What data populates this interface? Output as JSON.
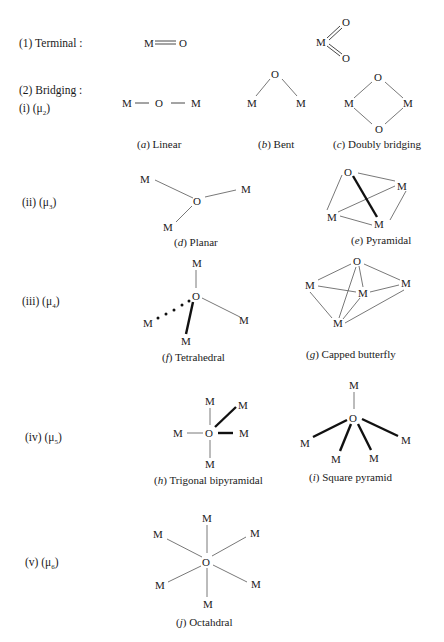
{
  "sections": [
    {
      "id": "terminal",
      "label": "(1) Terminal :"
    },
    {
      "id": "bridging",
      "label": "(2) Bridging :"
    },
    {
      "id": "mu2",
      "label": "(i) (μ",
      "sub": "2",
      "close": ")"
    },
    {
      "id": "mu3",
      "label": "(ii) (μ",
      "sub": "3",
      "close": ")"
    },
    {
      "id": "mu4",
      "label": "(iii) (μ",
      "sub": "4",
      "close": ")"
    },
    {
      "id": "mu5",
      "label": "(iv) (μ",
      "sub": "5",
      "close": ")"
    },
    {
      "id": "mu6",
      "label": "(v) (μ",
      "sub": "6",
      "close": ")"
    }
  ],
  "atoms": {
    "metal": "M",
    "oxygen": "O"
  },
  "captions": {
    "a": {
      "letter": "a",
      "text": "Linear"
    },
    "b": {
      "letter": "b",
      "text": "Bent"
    },
    "c": {
      "letter": "c",
      "text": "Doubly bridging"
    },
    "d": {
      "letter": "d",
      "text": "Planar"
    },
    "e": {
      "letter": "e",
      "text": "Pyramidal"
    },
    "f": {
      "letter": "f",
      "text": "Tetrahedral"
    },
    "g": {
      "letter": "g",
      "text": "Capped butterfly"
    },
    "h": {
      "letter": "h",
      "text": "Trigonal bipyramidal"
    },
    "i": {
      "letter": "i",
      "text": "Square pyramid"
    },
    "j": {
      "letter": "j",
      "text": "Octahdral"
    }
  },
  "colors": {
    "ink": "#1a1a1a",
    "bond": "#555555",
    "background": "#ffffff"
  }
}
